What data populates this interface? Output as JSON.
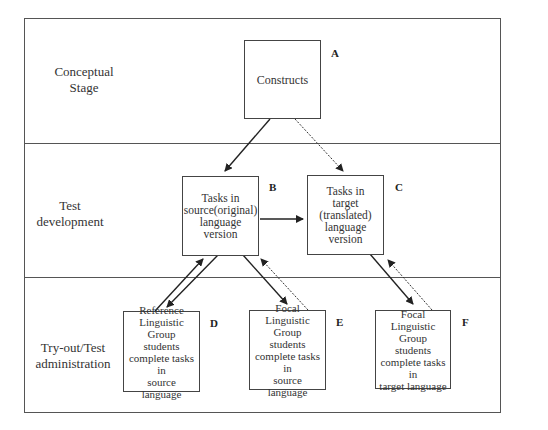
{
  "stages": [
    {
      "id": "conceptual",
      "label_lines": [
        "Conceptual",
        "Stage"
      ]
    },
    {
      "id": "test-development",
      "label_lines": [
        "Test",
        "development"
      ]
    },
    {
      "id": "tryout",
      "label_lines": [
        "Try-out/Test",
        "administration"
      ]
    }
  ],
  "nodes": {
    "A": {
      "letter": "A",
      "lines": [
        "Constructs"
      ]
    },
    "B": {
      "letter": "B",
      "lines": [
        "Tasks in",
        "source(original)",
        "language",
        "version"
      ]
    },
    "C": {
      "letter": "C",
      "lines": [
        "Tasks in",
        "target",
        "(translated)",
        "language",
        "version"
      ]
    },
    "D": {
      "letter": "D",
      "lines": [
        "Reference",
        "Linguistic",
        "Group",
        "students",
        "complete tasks in",
        "source language"
      ]
    },
    "E": {
      "letter": "E",
      "lines": [
        "Focal Linguistic",
        "Group",
        "students",
        "complete tasks in",
        "source language"
      ]
    },
    "F": {
      "letter": "F",
      "lines": [
        "Focal Linguistic",
        "Group",
        "students",
        "complete tasks in",
        "target language"
      ]
    }
  },
  "edges": [
    {
      "from": "A",
      "to": "B",
      "style": "solid"
    },
    {
      "from": "A",
      "to": "C",
      "style": "dotted"
    },
    {
      "from": "B",
      "to": "C",
      "style": "solid"
    },
    {
      "from": "B",
      "to": "D",
      "style": "solid"
    },
    {
      "from": "D",
      "to": "B",
      "style": "solid"
    },
    {
      "from": "B",
      "to": "E",
      "style": "solid"
    },
    {
      "from": "E",
      "to": "B",
      "style": "dotted"
    },
    {
      "from": "C",
      "to": "F",
      "style": "solid"
    },
    {
      "from": "F",
      "to": "C",
      "style": "dotted"
    }
  ]
}
